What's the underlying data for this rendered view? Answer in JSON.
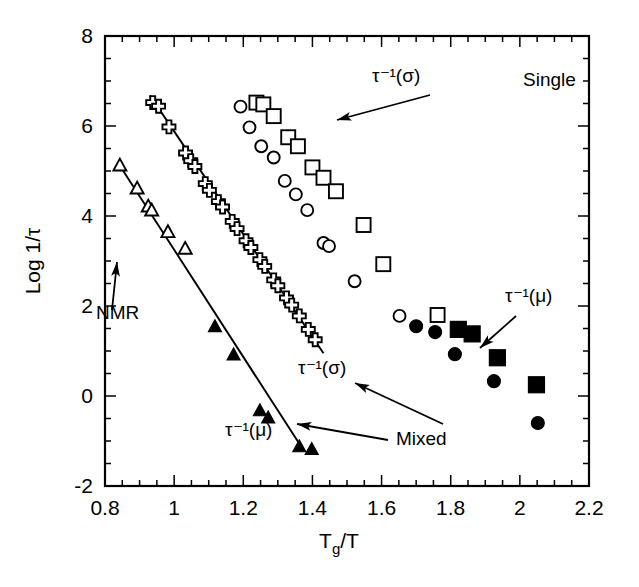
{
  "chart_data": {
    "type": "scatter",
    "title": "",
    "xlabel": "Tg/T",
    "ylabel": "Log 1/τ",
    "xlim": [
      0.8,
      2.2
    ],
    "ylim": [
      -2,
      8
    ],
    "xticks": [
      0.8,
      1,
      1.2,
      1.4,
      1.6,
      1.8,
      2,
      2.2
    ],
    "xticklabels": [
      "0.8",
      "1",
      "1.2",
      "1.4",
      "1.6",
      "1.8",
      "2",
      "2.2"
    ],
    "yticks": [
      -2,
      0,
      2,
      4,
      6,
      8
    ],
    "yticklabels": [
      "-2",
      "0",
      "2",
      "4",
      "6",
      "8"
    ],
    "x_minor_step": 0.05,
    "y_minor_step": 0.5,
    "grid": false,
    "legend": "none",
    "series": [
      {
        "name": "NMR open triangles",
        "marker": "triangle-open",
        "size": 13,
        "points": [
          [
            0.843,
            5.13
          ],
          [
            0.893,
            4.62
          ],
          [
            0.925,
            4.22
          ],
          [
            0.935,
            4.13
          ],
          [
            0.982,
            3.65
          ],
          [
            1.032,
            3.28
          ]
        ]
      },
      {
        "name": "tau-1(sigma) crosses",
        "marker": "cross-open",
        "size": 13,
        "points": [
          [
            0.938,
            6.52
          ],
          [
            0.955,
            6.44
          ],
          [
            0.985,
            5.98
          ],
          [
            1.033,
            5.4
          ],
          [
            1.048,
            5.23
          ],
          [
            1.06,
            5.1
          ],
          [
            1.09,
            4.72
          ],
          [
            1.102,
            4.57
          ],
          [
            1.128,
            4.32
          ],
          [
            1.14,
            4.2
          ],
          [
            1.168,
            3.88
          ],
          [
            1.182,
            3.72
          ],
          [
            1.208,
            3.45
          ],
          [
            1.222,
            3.3
          ],
          [
            1.248,
            3.03
          ],
          [
            1.262,
            2.88
          ],
          [
            1.288,
            2.58
          ],
          [
            1.3,
            2.45
          ],
          [
            1.325,
            2.18
          ],
          [
            1.34,
            2.02
          ],
          [
            1.362,
            1.78
          ],
          [
            1.388,
            1.48
          ],
          [
            1.408,
            1.25
          ]
        ]
      },
      {
        "name": "tau-1(mu) filled triangles",
        "marker": "triangle-filled",
        "size": 13,
        "points": [
          [
            1.118,
            1.55
          ],
          [
            1.172,
            0.92
          ],
          [
            1.248,
            -0.32
          ],
          [
            1.272,
            -0.48
          ],
          [
            1.362,
            -1.12
          ],
          [
            1.398,
            -1.18
          ]
        ]
      },
      {
        "name": "Single open circles",
        "marker": "circle-open",
        "size": 13,
        "points": [
          [
            1.192,
            6.43
          ],
          [
            1.218,
            5.97
          ],
          [
            1.252,
            5.55
          ],
          [
            1.288,
            5.3
          ],
          [
            1.32,
            4.78
          ],
          [
            1.352,
            4.48
          ],
          [
            1.385,
            4.13
          ],
          [
            1.432,
            3.4
          ],
          [
            1.448,
            3.33
          ],
          [
            1.522,
            2.55
          ],
          [
            1.652,
            1.78
          ]
        ]
      },
      {
        "name": "Single open squares",
        "marker": "square-open",
        "size": 14,
        "points": [
          [
            1.238,
            6.52
          ],
          [
            1.258,
            6.48
          ],
          [
            1.288,
            6.22
          ],
          [
            1.33,
            5.75
          ],
          [
            1.358,
            5.55
          ],
          [
            1.4,
            5.08
          ],
          [
            1.432,
            4.85
          ],
          [
            1.468,
            4.55
          ],
          [
            1.548,
            3.8
          ],
          [
            1.605,
            2.93
          ],
          [
            1.762,
            1.8
          ]
        ]
      },
      {
        "name": "Mixed filled circles",
        "marker": "circle-filled",
        "size": 14,
        "points": [
          [
            1.7,
            1.55
          ],
          [
            1.755,
            1.42
          ],
          [
            1.812,
            0.93
          ],
          [
            1.925,
            0.33
          ],
          [
            2.052,
            -0.6
          ]
        ]
      },
      {
        "name": "Mixed filled squares",
        "marker": "square-filled",
        "size": 16,
        "points": [
          [
            1.822,
            1.48
          ],
          [
            1.862,
            1.38
          ],
          [
            1.935,
            0.85
          ],
          [
            2.048,
            0.25
          ]
        ]
      }
    ],
    "fit_lines": [
      {
        "name": "NMR fit",
        "x": [
          0.838,
          1.372
        ],
        "y": [
          5.18,
          -1.18
        ]
      },
      {
        "name": "sigma fit",
        "x": [
          0.93,
          1.432
        ],
        "y": [
          6.68,
          0.95
        ]
      }
    ],
    "annotations": [
      {
        "name": "single-label",
        "text": "Single",
        "x": 523,
        "y": 86
      },
      {
        "name": "tau-sigma-top-label",
        "text": "τ⁻¹(σ)",
        "x": 372,
        "y": 82
      },
      {
        "name": "tau-sigma-lower-label",
        "text": "τ⁻¹(σ)",
        "x": 298,
        "y": 374
      },
      {
        "name": "tau-mu-lower-label",
        "text": "τ⁻¹(μ)",
        "x": 225,
        "y": 436
      },
      {
        "name": "tau-mu-right-label",
        "text": "τ⁻¹(μ)",
        "x": 505,
        "y": 302
      },
      {
        "name": "nmr-label",
        "text": "NMR",
        "x": 96,
        "y": 319
      },
      {
        "name": "mixed-label",
        "text": "Mixed",
        "x": 396,
        "y": 445
      }
    ]
  }
}
